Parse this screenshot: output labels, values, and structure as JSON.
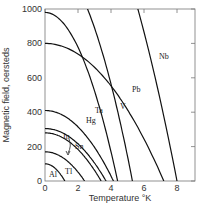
{
  "chart_data": {
    "type": "line",
    "title": "",
    "xlabel": "Temperature °K",
    "ylabel": "Magnetic field, oersteds",
    "xlim": [
      0,
      9
    ],
    "ylim": [
      0,
      1000
    ],
    "x_ticks": [
      0,
      2,
      4,
      6,
      8
    ],
    "y_ticks": [
      0,
      200,
      400,
      600,
      800,
      1000
    ],
    "grid": false,
    "legend": "inline curve labels",
    "series": [
      {
        "name": "Al",
        "H0": 100,
        "Tc": 1.2
      },
      {
        "name": "Tl",
        "H0": 170,
        "Tc": 2.4
      },
      {
        "name": "In",
        "H0": 280,
        "Tc": 3.4
      },
      {
        "name": "Sn",
        "H0": 305,
        "Tc": 3.7
      },
      {
        "name": "Hg",
        "H0": 410,
        "Tc": 4.15
      },
      {
        "name": "Ta",
        "H0": 980,
        "Tc": 4.4
      },
      {
        "name": "V",
        "H0": 1310,
        "Tc": 5.3
      },
      {
        "name": "Pb",
        "H0": 800,
        "Tc": 7.2
      },
      {
        "name": "Nb",
        "H0": 1980,
        "Tc": 8.0
      }
    ]
  },
  "labels": {
    "x_title": "Temperature °K",
    "y_title": "Magnetic field, oersteds",
    "x_ticks": [
      "0",
      "2",
      "4",
      "6",
      "8"
    ],
    "y_ticks": [
      "0",
      "200",
      "400",
      "600",
      "800",
      "1000"
    ],
    "curves": [
      "Al",
      "Tl",
      "In",
      "Sn",
      "Hg",
      "Ta",
      "V",
      "Pb",
      "Nb"
    ]
  }
}
